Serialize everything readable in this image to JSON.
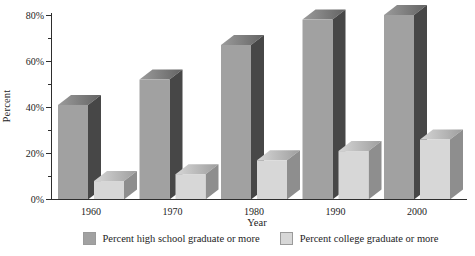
{
  "chart_data": {
    "type": "bar",
    "style": "3d-grouped",
    "title": "",
    "categories": [
      "1960",
      "1970",
      "1980",
      "1990",
      "2000"
    ],
    "series": [
      {
        "name": "Percent high school graduate or more",
        "values": [
          41,
          52,
          67,
          78,
          80
        ],
        "front_color": "#a1a1a1",
        "side_color": "#474747",
        "top_gradient": [
          "#9b9b9b",
          "#636363"
        ]
      },
      {
        "name": "Percent college graduate or more",
        "values": [
          8,
          11,
          17,
          21,
          26
        ],
        "front_color": "#d7d7d7",
        "side_color": "#8e8e8e",
        "top_gradient": [
          "#d6d6d6",
          "#9e9e9e"
        ]
      }
    ],
    "xlabel": "Year",
    "ylabel": "Percent",
    "ylim": [
      0,
      80
    ],
    "ytick_step": 20,
    "ytick_minor_step": 10,
    "ytick_suffix": "%",
    "legend_position": "bottom",
    "grid": false,
    "axis_color": "#2e2e2e",
    "text_color": "#1d1d1d"
  }
}
